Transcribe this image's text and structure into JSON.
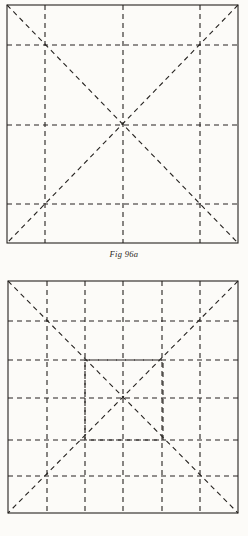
{
  "document": {
    "kind": "geometric-construction-plate",
    "background_color": "#fcfbf8",
    "ink_color": "#262320"
  },
  "figures": [
    {
      "id": "fig-96a",
      "caption": "Fig 96a",
      "description": "Square with dashed quarter grid and dashed full diagonals",
      "outer_square": {
        "x": 7,
        "y": 5,
        "width": 231,
        "height": 238
      },
      "grid_vertical_x": [
        45,
        123,
        200
      ],
      "grid_horizontal_y": [
        45,
        125,
        204
      ],
      "diagonals": [
        {
          "x1": 7,
          "y1": 5,
          "x2": 238,
          "y2": 243
        },
        {
          "x1": 238,
          "y1": 5,
          "x2": 7,
          "y2": 243
        }
      ],
      "inner_squares": []
    },
    {
      "id": "fig-96b",
      "caption": "Fig 96b",
      "description": "Square with dashed quarter grid, an inscribed inner dashed square, and dashed full diagonals",
      "outer_square": {
        "x": 8,
        "y": 281,
        "width": 230,
        "height": 232
      },
      "grid_vertical_x": [
        47,
        85,
        123,
        162,
        200
      ],
      "grid_horizontal_y": [
        321,
        360,
        398,
        440,
        476
      ],
      "diagonals": [
        {
          "x1": 8,
          "y1": 281,
          "x2": 238,
          "y2": 513
        },
        {
          "x1": 238,
          "y1": 281,
          "x2": 8,
          "y2": 513
        }
      ],
      "inner_squares": [
        {
          "x": 85,
          "y": 360,
          "width": 78,
          "height": 80
        }
      ]
    }
  ],
  "style_values": {
    "solid_stroke_width": 1.1,
    "dashed_stroke_width": 1.1,
    "dash_pattern": "5 4",
    "caption_font_size_px": 8.5
  }
}
